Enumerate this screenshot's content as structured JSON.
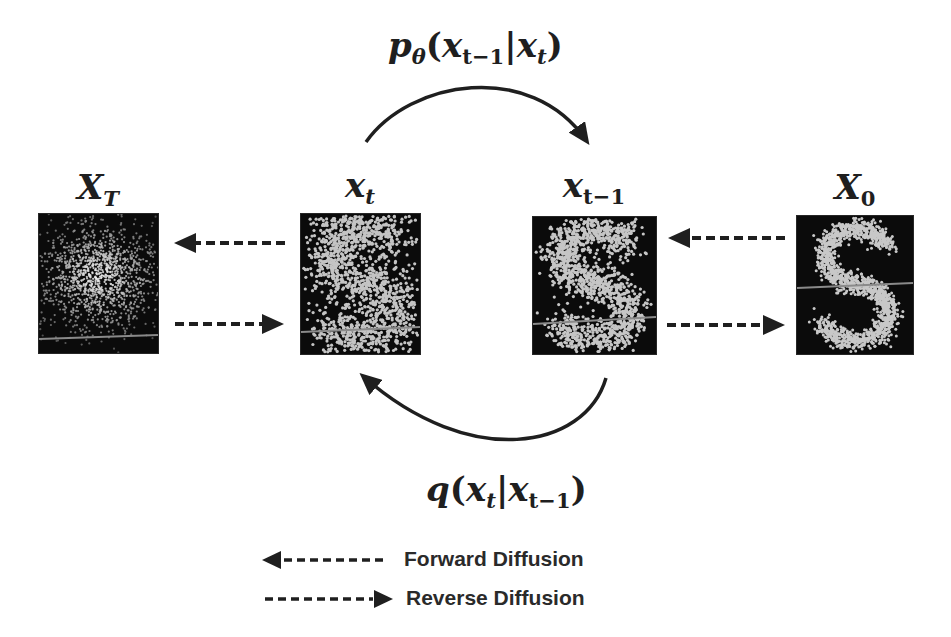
{
  "diagram": {
    "type": "diffusion-process",
    "states": [
      {
        "id": "xT",
        "label_base": "X",
        "label_sub": "T",
        "description": "pure noise (Gaussian blob)"
      },
      {
        "id": "xt",
        "label_base": "x",
        "label_sub": "t",
        "description": "noisy S shape"
      },
      {
        "id": "xt_minus_1",
        "label_base": "x",
        "label_sub": "t−1",
        "description": "less noisy S shape"
      },
      {
        "id": "x0",
        "label_base": "X",
        "label_sub": "0",
        "description": "clean S shape"
      }
    ],
    "formulas": {
      "reverse": {
        "fn": "p",
        "fn_sub": "θ",
        "open": "(",
        "a": "x",
        "a_sub": "t−1",
        "bar": "|",
        "b": "x",
        "b_sub": "t",
        "close": ")"
      },
      "forward": {
        "fn": "q",
        "open": "(",
        "a": "x",
        "a_sub": "t",
        "bar": "|",
        "b": "x",
        "b_sub": "t−1",
        "close": ")"
      }
    },
    "legend": [
      {
        "arrow": "dashed-left-arrow",
        "label": "Forward Diffusion"
      },
      {
        "arrow": "dashed-right-arrow",
        "label": "Reverse Diffusion"
      }
    ],
    "colors": {
      "ink": "#1f1f1f",
      "panel_bg": "#0b0b0b",
      "points": "#c8c8c8"
    }
  }
}
